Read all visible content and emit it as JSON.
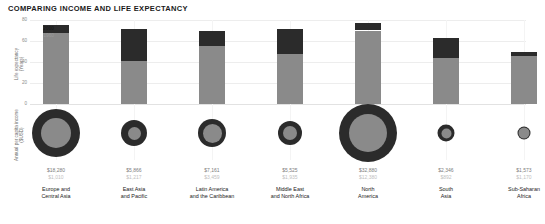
{
  "chart_data": {
    "type": "bar",
    "title": "COMPARING INCOME AND LIFE EXPECTANCY",
    "xlabel": "",
    "ylabel": "Life expectancy (Years)",
    "ylabel2": "Annual per capita income ($USD)",
    "ylim": [
      0,
      80
    ],
    "yticks": [
      "0",
      "20",
      "40",
      "60",
      "80"
    ],
    "grid": true,
    "legend_position": "inline-annotation",
    "series_names": [
      "2000",
      "1960"
    ],
    "annotations": {
      "upper": "2000",
      "lower": "1960"
    },
    "categories": [
      "Europe and Central Asia",
      "East Asia and Pacific",
      "Latin America and the Caribbean",
      "Middle East and North Africa",
      "North America",
      "South Asia",
      "Sub-Saharan Africa"
    ],
    "series": [
      {
        "name": "2000",
        "metric": "life_expectancy_years",
        "values": [
          75,
          71,
          70,
          71,
          77,
          63,
          50
        ]
      },
      {
        "name": "1960",
        "metric": "life_expectancy_years",
        "values": [
          68,
          41,
          55,
          48,
          70,
          44,
          46
        ]
      },
      {
        "name": "2000",
        "metric": "income_usd",
        "values": [
          18280,
          5866,
          7161,
          5525,
          32880,
          2346,
          1573
        ]
      },
      {
        "name": "1960",
        "metric": "income_usd",
        "values": [
          1010,
          1217,
          3459,
          1935,
          12380,
          892,
          1170
        ]
      }
    ]
  },
  "columns": [
    {
      "id": "europe-central-asia",
      "category_line1": "Europe and",
      "category_line2": "Central Asia",
      "life_2000": 75,
      "life_1960": 68,
      "income_2000_label": "$18,280",
      "income_1960_label": "$1,010",
      "bubble_outer_px": 48,
      "bubble_inner_px": 30
    },
    {
      "id": "east-asia-pacific",
      "category_line1": "East Asia",
      "category_line2": "and Pacific",
      "life_2000": 71,
      "life_1960": 41,
      "income_2000_label": "$5,866",
      "income_1960_label": "$1,217",
      "bubble_outer_px": 26,
      "bubble_inner_px": 13
    },
    {
      "id": "latin-america-caribbean",
      "category_line1": "Latin America",
      "category_line2": "and the Caribbean",
      "life_2000": 70,
      "life_1960": 55,
      "income_2000_label": "$7,161",
      "income_1960_label": "$3,459",
      "bubble_outer_px": 28,
      "bubble_inner_px": 19
    },
    {
      "id": "middle-east-north-africa",
      "category_line1": "Middle East",
      "category_line2": "and North Africa",
      "life_2000": 71,
      "life_1960": 48,
      "income_2000_label": "$5,525",
      "income_1960_label": "$1,935",
      "bubble_outer_px": 24,
      "bubble_inner_px": 14
    },
    {
      "id": "north-america",
      "category_line1": "North",
      "category_line2": "America",
      "life_2000": 77,
      "life_1960": 70,
      "income_2000_label": "$32,880",
      "income_1960_label": "$12,380",
      "bubble_outer_px": 58,
      "bubble_inner_px": 38
    },
    {
      "id": "south-asia",
      "category_line1": "South",
      "category_line2": "Asia",
      "life_2000": 63,
      "life_1960": 44,
      "income_2000_label": "$2,346",
      "income_1960_label": "$892",
      "bubble_outer_px": 17,
      "bubble_inner_px": 10
    },
    {
      "id": "sub-saharan-africa",
      "category_line1": "Sub-Saharan",
      "category_line2": "Africa",
      "life_2000": 50,
      "life_1960": 46,
      "income_2000_label": "$1,573",
      "income_1960_label": "$1,170",
      "bubble_outer_px": 13,
      "bubble_inner_px": 11
    }
  ],
  "axis": {
    "life_label_line1": "Life expectancy",
    "life_label_line2": "(Years)",
    "income_label_line1": "Annual per capita income",
    "income_label_line2": "($USD)",
    "ticks": [
      "80",
      "60",
      "40",
      "20",
      "0"
    ]
  },
  "colors": {
    "series_2000": "#2b2b2b",
    "series_1960": "#8a8a8a",
    "grid": "#ededed",
    "title": "#1a1a1a",
    "value_2000": "#7d7d7d",
    "value_1960": "#c0c0c0"
  }
}
